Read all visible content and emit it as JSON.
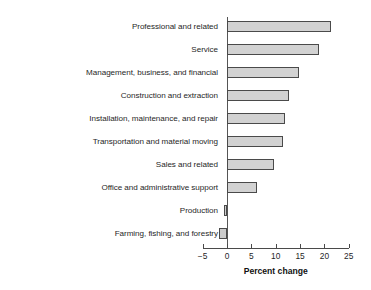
{
  "chart_data": {
    "type": "bar",
    "orientation": "horizontal",
    "title": "",
    "xlabel": "Percent change",
    "ylabel": "",
    "xlim": [
      -5,
      25
    ],
    "xticks": [
      -5,
      0,
      5,
      10,
      15,
      20,
      25
    ],
    "xtick_labels": [
      "−5",
      "0",
      "5",
      "10",
      "15",
      "20",
      "25"
    ],
    "grid": false,
    "legend": null,
    "bar_fill_color": "#d2d2d2",
    "bar_edge_color": "#4a4a4a",
    "axis_color": "#4a4a4a",
    "categories": [
      "Professional and related",
      "Service",
      "Management, business, and financial",
      "Construction and extraction",
      "Installation, maintenance, and repair",
      "Transportation and material moving",
      "Sales and related",
      "Office and administrative support",
      "Production",
      "Farming, fishing, and forestry"
    ],
    "values": [
      21.3,
      18.9,
      14.8,
      12.7,
      12.0,
      11.6,
      9.6,
      6.1,
      -0.7,
      -1.6
    ]
  }
}
